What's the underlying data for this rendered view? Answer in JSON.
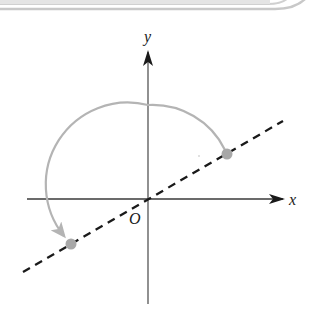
{
  "diagram": {
    "axes": {
      "x_label": "x",
      "y_label": "y",
      "origin_label": "O"
    },
    "line": {
      "style": "dashed",
      "color": "#1a1a1a",
      "description": "line through origin"
    },
    "points": [
      {
        "name": "upper-point",
        "color": "#a8a8a8"
      },
      {
        "name": "lower-point",
        "color": "#a8a8a8"
      }
    ],
    "rotation_arc": {
      "color": "#b4b4b4",
      "direction": "counterclockwise",
      "description": "arc from upper point to lower point"
    },
    "frame": {
      "color": "#c8c8c8"
    }
  }
}
